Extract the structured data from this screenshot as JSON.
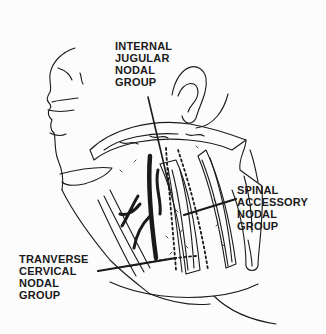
{
  "diagram": {
    "labels": [
      {
        "id": "internal-jugular",
        "lines": [
          "INTERNAL",
          "JUGULAR",
          "NODAL",
          "GROUP"
        ]
      },
      {
        "id": "spinal-accessory",
        "lines": [
          "SPINAL",
          "ACCESSORY",
          "NODAL",
          "GROUP"
        ]
      },
      {
        "id": "transverse-cervical",
        "lines": [
          "TRANVERSE",
          "CERVICAL",
          "NODAL",
          "GROUP"
        ]
      }
    ],
    "colors": {
      "ink": "#1a1a1a",
      "background": "#fcfcfc"
    }
  }
}
